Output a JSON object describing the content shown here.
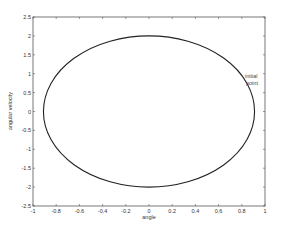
{
  "chart_data": {
    "type": "line",
    "title": "",
    "xlabel": "angle",
    "ylabel": "angular velocity",
    "xlim": [
      -1,
      1
    ],
    "ylim": [
      -2.5,
      2.5
    ],
    "grid": false,
    "legend": null,
    "x_ticks": [
      -1,
      -0.8,
      -0.6,
      -0.4,
      -0.2,
      0,
      0.2,
      0.4,
      0.6,
      0.8,
      1
    ],
    "x_tick_labels": [
      "-1",
      "-0.8",
      "-0.6",
      "-0.4",
      "-0.2",
      "0",
      "0.2",
      "0.4",
      "0.6",
      "0.8",
      "1"
    ],
    "y_ticks": [
      -2.5,
      -2,
      -1.5,
      -1,
      -0.5,
      0,
      0.5,
      1,
      1.5,
      2,
      2.5
    ],
    "y_tick_labels": [
      "-2.5",
      "-2",
      "-1.5",
      "-1",
      "-0.5",
      "0",
      "0.5",
      "1",
      "1.5",
      "2",
      "2.5"
    ],
    "series": [
      {
        "name": "phase trajectory",
        "shape": "ellipse",
        "center": [
          0,
          0
        ],
        "semi_axis_x": 0.91,
        "semi_axis_y": 2.0,
        "color": "#222222"
      }
    ],
    "annotations": [
      {
        "text_line1": "initial",
        "text_line2": "point",
        "x": 0.83,
        "y": 0.9
      }
    ]
  },
  "colors": {
    "axis": "#555555",
    "curve": "#222222",
    "background": "#ffffff"
  }
}
